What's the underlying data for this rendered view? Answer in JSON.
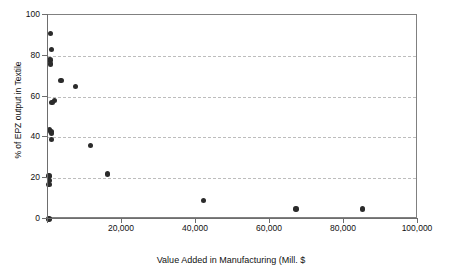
{
  "chart_data": {
    "type": "scatter",
    "title": "",
    "xlabel": "Value Added in Manufacturing (Mill. $",
    "ylabel": "% of EPZ output in Textile",
    "xlim": [
      0,
      100000
    ],
    "ylim": [
      0,
      100
    ],
    "xticks": [
      0,
      20000,
      40000,
      60000,
      80000,
      100000
    ],
    "xticklabels": [
      "",
      "20,000",
      "40,000",
      "60,000",
      "80,000",
      "100,000"
    ],
    "yticks": [
      0,
      20,
      40,
      60,
      80,
      100
    ],
    "yticklabels": [
      "0",
      "20",
      "40",
      "60",
      "80",
      "100"
    ],
    "grid": "horizontal-dashed",
    "legend": "none",
    "marker": "filled-circle",
    "marker_color": "#2b2b2b",
    "points": [
      {
        "x": 600,
        "y": 91
      },
      {
        "x": 900,
        "y": 83
      },
      {
        "x": 500,
        "y": 78
      },
      {
        "x": 700,
        "y": 76
      },
      {
        "x": 1700,
        "y": 58
      },
      {
        "x": 1100,
        "y": 57
      },
      {
        "x": 400,
        "y": 44
      },
      {
        "x": 800,
        "y": 43
      },
      {
        "x": 900,
        "y": 42
      },
      {
        "x": 1000,
        "y": 39
      },
      {
        "x": 300,
        "y": 21
      },
      {
        "x": 400,
        "y": 19
      },
      {
        "x": 300,
        "y": 17
      },
      {
        "x": 300,
        "y": 0
      },
      {
        "x": 3500,
        "y": 68
      },
      {
        "x": 7500,
        "y": 65
      },
      {
        "x": 11500,
        "y": 36
      },
      {
        "x": 16000,
        "y": 22
      },
      {
        "x": 42000,
        "y": 9
      },
      {
        "x": 67000,
        "y": 5
      },
      {
        "x": 85000,
        "y": 5
      }
    ]
  }
}
